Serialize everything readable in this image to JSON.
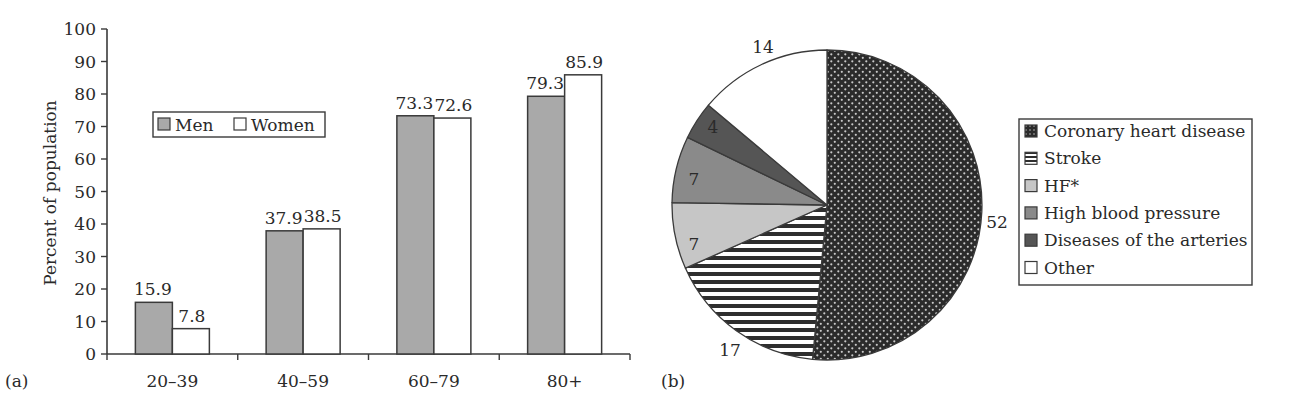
{
  "chart_data": [
    {
      "type": "bar",
      "panel_label": "(a)",
      "title": "",
      "xlabel": "",
      "ylabel": "Percent of population",
      "ylim": [
        0,
        100
      ],
      "yticks": [
        0,
        10,
        20,
        30,
        40,
        50,
        60,
        70,
        80,
        90,
        100
      ],
      "grid": false,
      "legend_position": "upper-left inside",
      "categories": [
        "20–39",
        "40–59",
        "60–79",
        "80+"
      ],
      "series": [
        {
          "name": "Men",
          "color": "#a9a9a9",
          "values": [
            15.9,
            37.9,
            73.3,
            79.3
          ]
        },
        {
          "name": "Women",
          "color": "#ffffff",
          "values": [
            7.8,
            38.5,
            72.6,
            85.9
          ]
        }
      ]
    },
    {
      "type": "pie",
      "panel_label": "(b)",
      "title": "",
      "legend_position": "right",
      "start_angle": "12 o'clock, clockwise",
      "slices": [
        {
          "label": "Coronary heart disease",
          "value": 52,
          "fill": "#2b2b2b",
          "pattern": "dots"
        },
        {
          "label": "Stroke",
          "value": 17,
          "fill": "#ffffff",
          "pattern": "horizontal-stripes"
        },
        {
          "label": "HF*",
          "value": 7,
          "fill": "#c6c6c6",
          "pattern": "solid"
        },
        {
          "label": "High blood pressure",
          "value": 7,
          "fill": "#8a8a8a",
          "pattern": "solid"
        },
        {
          "label": "Diseases of the arteries",
          "value": 4,
          "fill": "#555555",
          "pattern": "solid"
        },
        {
          "label": "Other",
          "value": 14,
          "fill": "#ffffff",
          "pattern": "solid"
        }
      ]
    }
  ]
}
